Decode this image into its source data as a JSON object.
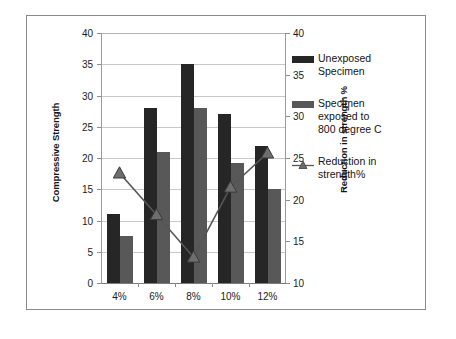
{
  "chart_data": {
    "type": "bar",
    "title": "",
    "subtitle": "",
    "xlabel": "",
    "ylabel": "Compressive Strength",
    "y2label": "Reduction in strength %",
    "categories": [
      "4%",
      "6%",
      "8%",
      "10%",
      "12%"
    ],
    "series": [
      {
        "name": "Unexposed Specimen",
        "type": "bar",
        "axis": "left",
        "color": "#262626",
        "values": [
          11,
          28,
          35,
          27,
          22
        ]
      },
      {
        "name": "Specimen exposed to 800 degree  C",
        "type": "bar",
        "axis": "left",
        "color": "#585858",
        "values": [
          7.5,
          21,
          28,
          19.2,
          15
        ]
      },
      {
        "name": "Reduction in strength%",
        "type": "line",
        "axis": "right",
        "color": "#555555",
        "marker": "triangle",
        "values": [
          23.2,
          18.2,
          13.1,
          21.5,
          25.6
        ]
      }
    ],
    "ylim": [
      0,
      40
    ],
    "yticks": [
      0,
      5,
      10,
      15,
      20,
      25,
      30,
      35,
      40
    ],
    "y2lim": [
      10,
      40
    ],
    "y2ticks": [
      10,
      15,
      20,
      25,
      30,
      35,
      40
    ],
    "grid": true,
    "legend_position": "right"
  },
  "axes": {
    "left_title": "Compressive Strength",
    "right_title": "Reduction in strength %",
    "left_ticks": [
      "40",
      "35",
      "30",
      "25",
      "20",
      "15",
      "10",
      "5",
      "0"
    ],
    "right_ticks": [
      "40",
      "35",
      "30",
      "25",
      "20",
      "15",
      "10"
    ],
    "x_ticks": [
      "4%",
      "6%",
      "8%",
      "10%",
      "12%"
    ]
  },
  "legend": {
    "items": [
      {
        "key": "bar-dark-swatch",
        "label": "Unexposed\nSpecimen"
      },
      {
        "key": "bar-gray-swatch",
        "label": "Specimen\nexposed to\n800 degree  C"
      },
      {
        "key": "line-triangle-swatch",
        "label": "Reduction in\nstrength%"
      }
    ]
  },
  "colors": {
    "series1": "#262626",
    "series2": "#585858",
    "line": "#555555",
    "grid": "#c8c8c8",
    "frame": "#8a8a8a"
  }
}
